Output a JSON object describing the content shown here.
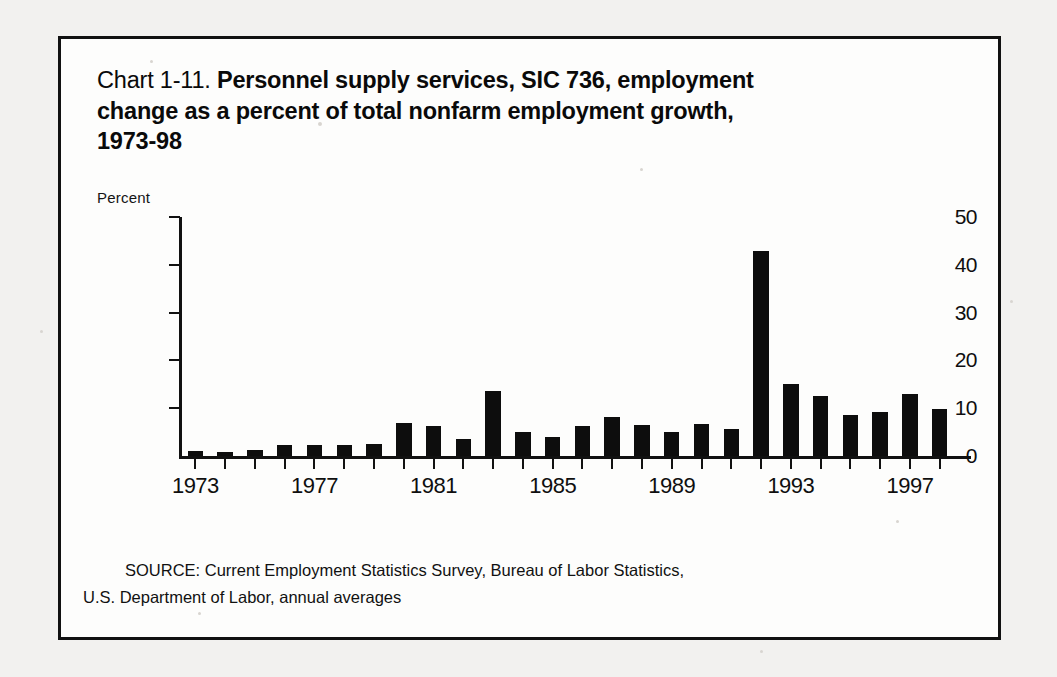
{
  "title": {
    "prefix": "Chart 1-11. ",
    "line1_bold": "Personnel supply services, SIC 736, employment",
    "line2": "change as a percent of total nonfarm employment growth,",
    "line3": "1973-98"
  },
  "axis": {
    "y_axis_title": "Percent"
  },
  "source": {
    "line1": "SOURCE: Current Employment Statistics Survey, Bureau of Labor Statistics,",
    "line2": "U.S. Department of Labor, annual averages"
  },
  "colors": {
    "bar": "#0d0d0d",
    "axis": "#111111",
    "frame": "#111111",
    "text": "#0f0f0f",
    "page_background": "#f2f1ef",
    "figure_background": "#fdfdfc"
  },
  "chart_data": {
    "type": "bar",
    "title": "Chart 1-11. Personnel supply services, SIC 736, employment change as a percent of total nonfarm employment growth, 1973-98",
    "xlabel": "",
    "ylabel": "Percent",
    "ylim": [
      0,
      50
    ],
    "yticks": [
      0,
      10,
      20,
      30,
      40,
      50
    ],
    "ytick_labels": [
      "0",
      "10",
      "20",
      "30",
      "40",
      "50"
    ],
    "xtick_labels": [
      "1973",
      "1977",
      "1981",
      "1985",
      "1989",
      "1993",
      "1997"
    ],
    "xtick_years": [
      1973,
      1977,
      1981,
      1985,
      1989,
      1993,
      1997
    ],
    "grid": false,
    "legend": false,
    "categories": [
      "1973",
      "1974",
      "1975",
      "1976",
      "1977",
      "1978",
      "1979",
      "1980",
      "1981",
      "1982",
      "1983",
      "1984",
      "1985",
      "1986",
      "1987",
      "1988",
      "1989",
      "1990",
      "1991",
      "1992",
      "1993",
      "1994",
      "1995",
      "1996",
      "1997",
      "1998"
    ],
    "values": [
      1.0,
      0.8,
      1.3,
      2.3,
      2.2,
      2.2,
      2.5,
      6.8,
      6.3,
      3.5,
      13.7,
      5.0,
      4.0,
      6.2,
      8.2,
      6.5,
      5.0,
      6.7,
      5.7,
      42.8,
      15.0,
      12.5,
      8.6,
      9.3,
      13.0,
      9.8
    ]
  }
}
